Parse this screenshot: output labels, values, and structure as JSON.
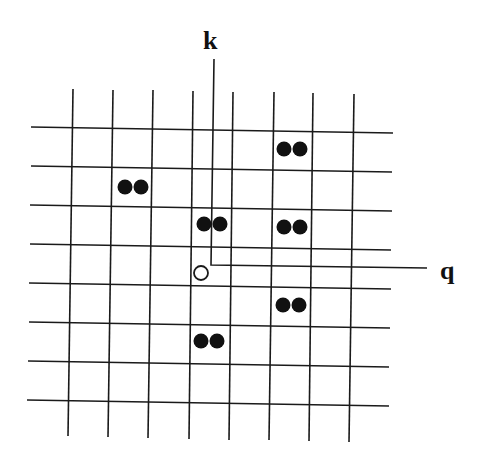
{
  "diagram": {
    "type": "lattice-grid",
    "labels": {
      "k": "k",
      "q": "q"
    },
    "colors": {
      "line": "#1a1a1a",
      "dot": "#111111",
      "background": "#ffffff"
    },
    "grid": {
      "vertical_lines": [
        {
          "x1": 73,
          "y1": 89,
          "x2": 68,
          "y2": 436
        },
        {
          "x1": 113,
          "y1": 90,
          "x2": 108,
          "y2": 437
        },
        {
          "x1": 153,
          "y1": 90,
          "x2": 148,
          "y2": 438
        },
        {
          "x1": 193,
          "y1": 91,
          "x2": 189,
          "y2": 439
        },
        {
          "x1": 233,
          "y1": 92,
          "x2": 229,
          "y2": 440
        },
        {
          "x1": 274,
          "y1": 92,
          "x2": 269,
          "y2": 440
        },
        {
          "x1": 313,
          "y1": 93,
          "x2": 309,
          "y2": 441
        },
        {
          "x1": 354,
          "y1": 94,
          "x2": 349,
          "y2": 442
        }
      ],
      "horizontal_lines": [
        {
          "x1": 31,
          "y1": 127,
          "x2": 393,
          "y2": 133
        },
        {
          "x1": 31,
          "y1": 166,
          "x2": 392,
          "y2": 172
        },
        {
          "x1": 30,
          "y1": 205,
          "x2": 392,
          "y2": 211
        },
        {
          "x1": 30,
          "y1": 244,
          "x2": 391,
          "y2": 250
        },
        {
          "x1": 29,
          "y1": 283,
          "x2": 391,
          "y2": 289
        },
        {
          "x1": 29,
          "y1": 322,
          "x2": 390,
          "y2": 328
        },
        {
          "x1": 28,
          "y1": 361,
          "x2": 389,
          "y2": 367
        },
        {
          "x1": 27,
          "y1": 400,
          "x2": 389,
          "y2": 406
        }
      ]
    },
    "dot_pairs": [
      {
        "cx": 292,
        "cy": 149
      },
      {
        "cx": 133,
        "cy": 187
      },
      {
        "cx": 212,
        "cy": 224
      },
      {
        "cx": 292,
        "cy": 227
      },
      {
        "cx": 291,
        "cy": 305
      },
      {
        "cx": 209,
        "cy": 341
      }
    ],
    "open_circle": {
      "cx": 201,
      "cy": 273,
      "r": 7
    },
    "k_path": "M 214 59 L 211 265 L 427 268",
    "k_label_pos": {
      "x": 203,
      "y": 28
    },
    "q_label_pos": {
      "x": 440,
      "y": 258
    }
  }
}
